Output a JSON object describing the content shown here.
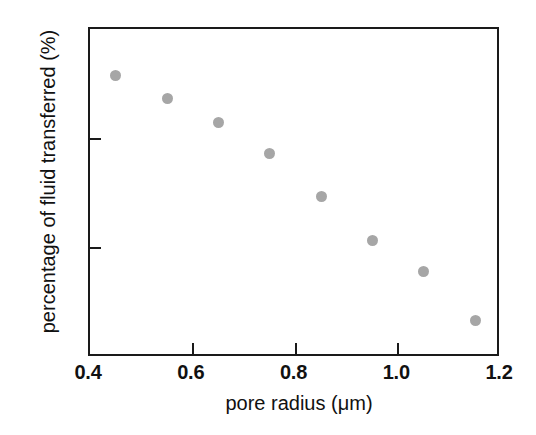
{
  "chart_data": {
    "type": "scatter",
    "title": "",
    "xlabel": "pore radius (μm)",
    "ylabel": "percentage of fluid transferred (%)",
    "xlim": [
      0.4,
      1.2
    ],
    "ylim": [
      58,
      70
    ],
    "xticks": [
      "0.4",
      "0.6",
      "0.8",
      "1.0",
      "1.2"
    ],
    "xtick_values": [
      0.4,
      0.6,
      0.8,
      1.0,
      1.2
    ],
    "yticks": [
      "58",
      "62",
      "66",
      "70"
    ],
    "ytick_values": [
      58,
      62,
      66,
      70
    ],
    "grid": false,
    "legend": null,
    "marker": {
      "shape": "circle",
      "color": "#a6a6a6",
      "size_px": 11
    },
    "axis_color": "#1a1a1a",
    "background": "#ffffff",
    "points": [
      {
        "x": 0.45,
        "y": 68.3
      },
      {
        "x": 0.55,
        "y": 67.45
      },
      {
        "x": 0.65,
        "y": 66.6
      },
      {
        "x": 0.75,
        "y": 65.45
      },
      {
        "x": 0.85,
        "y": 63.9
      },
      {
        "x": 0.95,
        "y": 62.3
      },
      {
        "x": 1.05,
        "y": 61.15
      },
      {
        "x": 1.15,
        "y": 59.35
      }
    ],
    "series": [
      {
        "name": "fluid transfer vs pore radius",
        "x": [
          0.45,
          0.55,
          0.65,
          0.75,
          0.85,
          0.95,
          1.05,
          1.15
        ],
        "values": [
          68.3,
          67.45,
          66.6,
          65.45,
          63.9,
          62.3,
          61.15,
          59.35
        ]
      }
    ]
  }
}
